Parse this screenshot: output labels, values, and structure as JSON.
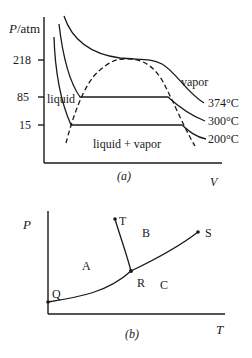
{
  "figure_a": {
    "y_axis_label_italic": "P",
    "y_axis_label_unit": "/atm",
    "x_axis_label": "V",
    "caption": "(a)",
    "ticks": [
      {
        "label": "218",
        "value": 218
      },
      {
        "label": "85",
        "value": 85
      },
      {
        "label": "15",
        "value": 15
      }
    ],
    "region_labels": {
      "liquid": "liquid",
      "liquid_vapor": "liquid + vapor",
      "vapor": "vapor"
    },
    "isotherms": [
      {
        "label": "374°C",
        "pressure_plateau": null
      },
      {
        "label": "300°C",
        "pressure_plateau": 85
      },
      {
        "label": "200°C",
        "pressure_plateau": 15
      }
    ],
    "critical_pressure": 218
  },
  "figure_b": {
    "y_axis_label": "P",
    "x_axis_label": "T",
    "caption": "(b)",
    "points": {
      "Q": "Q",
      "R": "R",
      "S": "S",
      "T": "T"
    },
    "regions": {
      "A": "A",
      "B": "B",
      "C": "C"
    }
  }
}
